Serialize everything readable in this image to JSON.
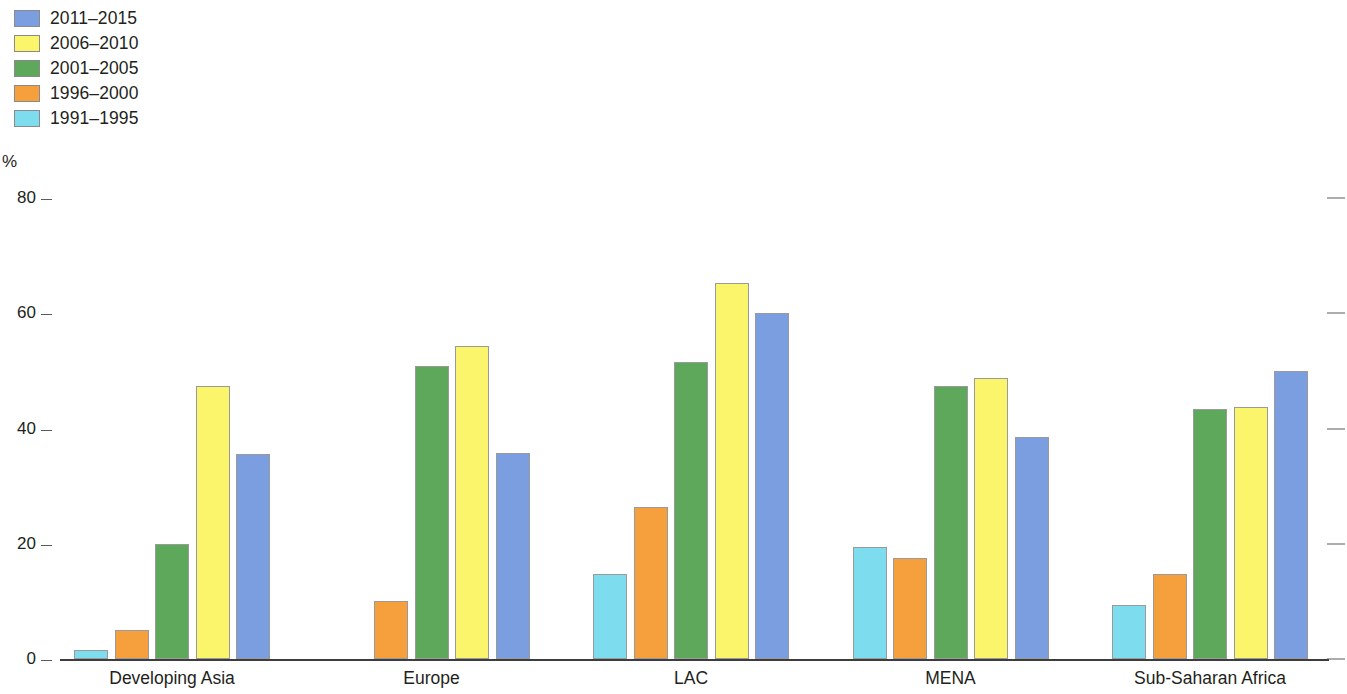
{
  "legend": {
    "items": [
      {
        "label": "2011–2015",
        "color": "#7b9ee0"
      },
      {
        "label": "2006–2010",
        "color": "#faf56b"
      },
      {
        "label": "2001–2005",
        "color": "#5da85a"
      },
      {
        "label": "1996–2000",
        "color": "#f5a03c"
      },
      {
        "label": "1991–1995",
        "color": "#7dddef"
      }
    ]
  },
  "axis": {
    "unit": "%",
    "ticks": [
      "80",
      "60",
      "40",
      "20",
      "0"
    ]
  },
  "chart_data": {
    "type": "bar",
    "title": "",
    "subtitle": "",
    "xlabel": "",
    "ylabel": "%",
    "ylim": [
      0,
      80
    ],
    "yticks": [
      0,
      20,
      40,
      60,
      80
    ],
    "grid": false,
    "legend_position": "top-left",
    "categories": [
      "Developing Asia",
      "Europe",
      "LAC",
      "MENA",
      "Sub-Saharan Africa"
    ],
    "series": [
      {
        "name": "1991–1995",
        "color": "#7dddef",
        "values": [
          1.5,
          0,
          14.8,
          19.4,
          9.4
        ]
      },
      {
        "name": "1996–2000",
        "color": "#f5a03c",
        "values": [
          5.0,
          10.0,
          26.4,
          17.5,
          14.7
        ]
      },
      {
        "name": "2001–2005",
        "color": "#5da85a",
        "values": [
          19.9,
          50.8,
          51.5,
          47.3,
          43.3
        ]
      },
      {
        "name": "2006–2010",
        "color": "#faf56b",
        "values": [
          47.4,
          54.4,
          65.2,
          48.8,
          43.8
        ]
      },
      {
        "name": "2011–2015",
        "color": "#7b9ee0",
        "values": [
          35.5,
          35.8,
          60.0,
          38.5,
          49.9
        ]
      }
    ]
  }
}
